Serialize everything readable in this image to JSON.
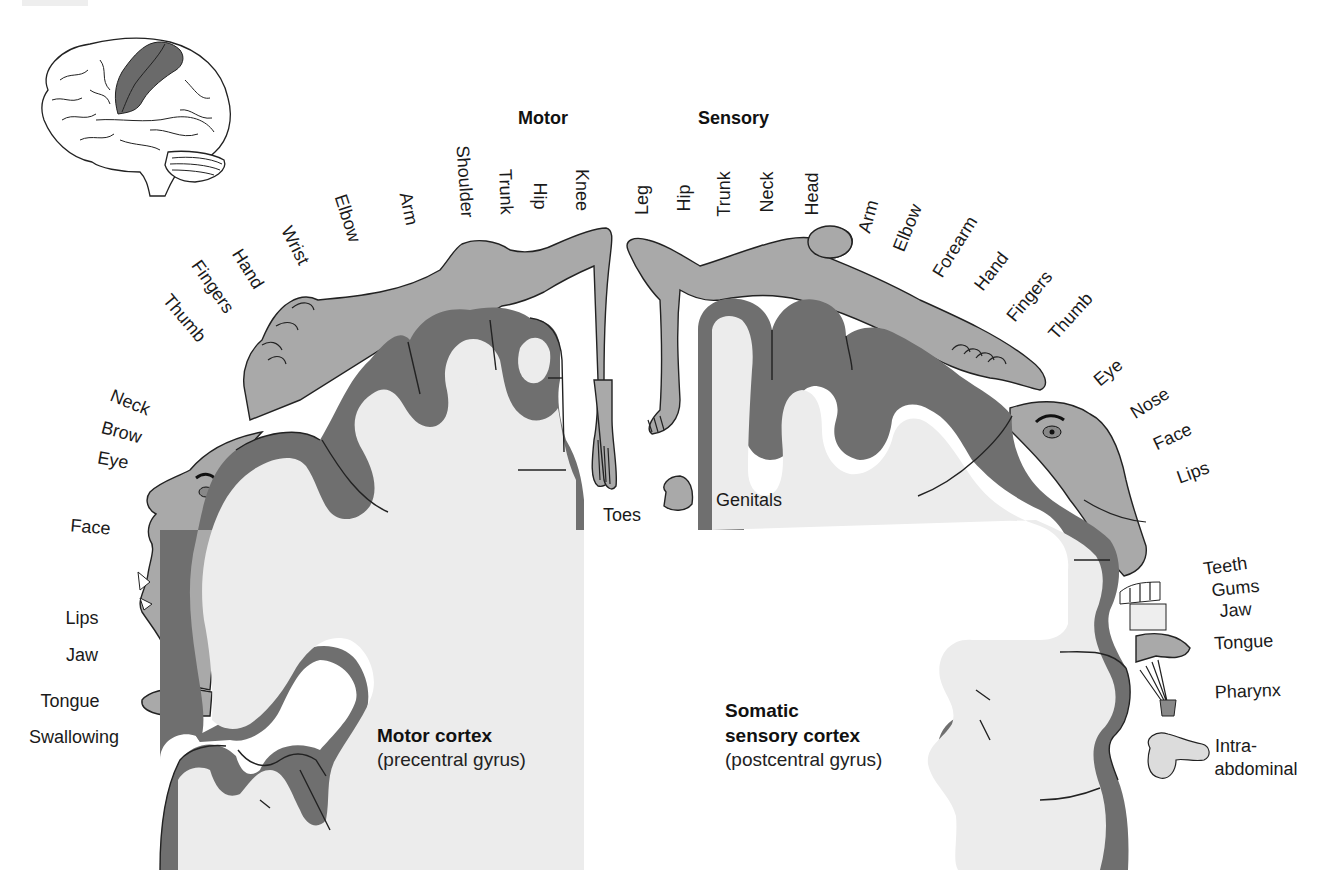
{
  "headers": {
    "motor": "Motor",
    "sensory": "Sensory"
  },
  "motor_labels": [
    {
      "text": "Thumb",
      "x": 180,
      "y": 322,
      "rot": 50
    },
    {
      "text": "Fingers",
      "x": 208,
      "y": 290,
      "rot": 55
    },
    {
      "text": "Hand",
      "x": 243,
      "y": 272,
      "rot": 58
    },
    {
      "text": "Wrist",
      "x": 290,
      "y": 248,
      "rot": 63
    },
    {
      "text": "Elbow",
      "x": 342,
      "y": 220,
      "rot": 72
    },
    {
      "text": "Arm",
      "x": 403,
      "y": 210,
      "rot": 78
    },
    {
      "text": "Shoulder",
      "x": 459,
      "y": 182,
      "rot": 86
    },
    {
      "text": "Trunk",
      "x": 500,
      "y": 192,
      "rot": 88
    },
    {
      "text": "Hip",
      "x": 534,
      "y": 196,
      "rot": 90
    },
    {
      "text": "Knee",
      "x": 576,
      "y": 190,
      "rot": 90
    }
  ],
  "motor_face_labels": [
    {
      "text": "Neck",
      "x": 128,
      "y": 408,
      "rot": 22
    },
    {
      "text": "Brow",
      "x": 120,
      "y": 438,
      "rot": 15
    },
    {
      "text": "Eye",
      "x": 112,
      "y": 466,
      "rot": 10
    },
    {
      "text": "Face",
      "x": 90,
      "y": 533,
      "rot": 5
    },
    {
      "text": "Lips",
      "x": 82,
      "y": 624,
      "rot": 0
    },
    {
      "text": "Jaw",
      "x": 82,
      "y": 661,
      "rot": 0
    },
    {
      "text": "Tongue",
      "x": 70,
      "y": 707,
      "rot": 0
    },
    {
      "text": "Swallowing",
      "x": 74,
      "y": 743,
      "rot": 0
    }
  ],
  "toes_label": {
    "text": "Toes",
    "x": 626,
    "y": 521
  },
  "sensory_labels": [
    {
      "text": "Leg",
      "x": 648,
      "y": 200,
      "rot": -90
    },
    {
      "text": "Hip",
      "x": 690,
      "y": 198,
      "rot": -90
    },
    {
      "text": "Trunk",
      "x": 730,
      "y": 194,
      "rot": -90
    },
    {
      "text": "Neck",
      "x": 773,
      "y": 192,
      "rot": -90
    },
    {
      "text": "Head",
      "x": 818,
      "y": 194,
      "rot": -90
    },
    {
      "text": "Arm",
      "x": 874,
      "y": 218,
      "rot": -75
    },
    {
      "text": "Elbow",
      "x": 913,
      "y": 230,
      "rot": -68
    },
    {
      "text": "Forearm",
      "x": 960,
      "y": 250,
      "rot": -58
    },
    {
      "text": "Hand",
      "x": 996,
      "y": 275,
      "rot": -52
    },
    {
      "text": "Fingers",
      "x": 1034,
      "y": 300,
      "rot": -50
    },
    {
      "text": "Thumb",
      "x": 1075,
      "y": 320,
      "rot": -48
    },
    {
      "text": "Eye",
      "x": 1112,
      "y": 377,
      "rot": -40
    },
    {
      "text": "Nose",
      "x": 1153,
      "y": 408,
      "rot": -32
    },
    {
      "text": "Face",
      "x": 1175,
      "y": 442,
      "rot": -25
    },
    {
      "text": "Lips",
      "x": 1195,
      "y": 478,
      "rot": -20
    }
  ],
  "sensory_mouth_labels": [
    {
      "text": "Teeth",
      "x": 1226,
      "y": 572,
      "rot": -8
    },
    {
      "text": "Gums",
      "x": 1236,
      "y": 594,
      "rot": -6
    },
    {
      "text": "Jaw",
      "x": 1236,
      "y": 616,
      "rot": -4
    },
    {
      "text": "Tongue",
      "x": 1244,
      "y": 648,
      "rot": -3
    },
    {
      "text": "Pharynx",
      "x": 1248,
      "y": 697,
      "rot": -2
    },
    {
      "text": "Intra-",
      "x": 1236,
      "y": 752,
      "rot": 0
    },
    {
      "text": "abdominal",
      "x": 1256,
      "y": 775,
      "rot": 0
    }
  ],
  "genitals_label": {
    "text": "Genitals",
    "x": 753,
    "y": 503
  },
  "motor_cortex": {
    "title": "Motor cortex",
    "subtitle": "(precentral gyrus)"
  },
  "sensory_cortex": {
    "title_line1": "Somatic",
    "title_line2": "sensory cortex",
    "subtitle": "(postcentral gyrus)"
  },
  "inset": {
    "description": "Lateral brain view with precentral and postcentral gyri highlighted"
  },
  "colors": {
    "homunculus_fill": "#a9a9a9",
    "cortex_gray": "#6f6f6f",
    "white_matter": "#ececec",
    "inset_highlight": "#6a6a6a"
  }
}
